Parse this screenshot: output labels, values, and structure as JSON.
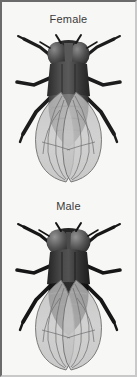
{
  "figure": {
    "background_color": "#f7f7f5",
    "border_dark_color": "#6b6b6b",
    "border_light_color": "#c9c9c9",
    "view": "dorsal",
    "rendering": "grayscale photographic illustration",
    "panel_count": 2
  },
  "panels": [
    {
      "id": "female",
      "label": "Female",
      "label_color": "#3a3a3a",
      "eye_arrangement": "dichoptic",
      "abdomen_tone": "#6a6a6a",
      "wing_tone": "#c8c8c8",
      "body_color": "#2b2b2b"
    },
    {
      "id": "male",
      "label": "Male",
      "label_color": "#3a3a3a",
      "eye_arrangement": "holoptic",
      "abdomen_tone": "#141414",
      "wing_tone": "#c8c8c8",
      "body_color": "#222222"
    }
  ],
  "colors": {
    "background": "#f7f7f5",
    "text": "#3a3a3a",
    "body_dark": "#1c1c1c",
    "body_mid": "#555555",
    "wing_fill": "#c8c8c8",
    "wing_vein": "#6e6e6e",
    "eye_dark": "#3b3b3b",
    "eye_light": "#7d7d7d"
  }
}
